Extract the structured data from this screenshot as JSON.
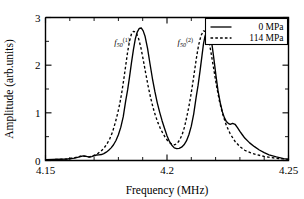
{
  "chart_data": {
    "type": "line",
    "title": "",
    "xlabel": "Frequency (MHz)",
    "ylabel": "Amplitude (arb.units)",
    "xlim": [
      4.15,
      4.25
    ],
    "ylim": [
      0,
      3
    ],
    "xticks": [
      "4.15",
      "4.2",
      "4.25"
    ],
    "xtick_values": [
      4.15,
      4.2,
      4.25
    ],
    "xminor_step": 0.01,
    "yticks": [
      "0",
      "1",
      "2",
      "3"
    ],
    "ytick_values": [
      0,
      1,
      2,
      3
    ],
    "yminor_step": 0.5,
    "grid": false,
    "legend_position": "top-right",
    "annotations": [
      {
        "name": "peak-label-1",
        "base": "f",
        "sub": "50",
        "sup": "(1)",
        "x": 4.1815,
        "y": 2.42
      },
      {
        "name": "peak-label-2",
        "base": "f",
        "sub": "50",
        "sup": "(2)",
        "x": 4.2075,
        "y": 2.42
      }
    ],
    "series": [
      {
        "name": "0 MPa",
        "style": "solid",
        "color": "#000000",
        "x": [
          4.15,
          4.153,
          4.156,
          4.159,
          4.162,
          4.164,
          4.1655,
          4.1668,
          4.168,
          4.169,
          4.17,
          4.171,
          4.172,
          4.173,
          4.174,
          4.175,
          4.176,
          4.177,
          4.178,
          4.179,
          4.18,
          4.181,
          4.182,
          4.183,
          4.1838,
          4.1846,
          4.1854,
          4.1862,
          4.187,
          4.1878,
          4.1886,
          4.1894,
          4.1902,
          4.191,
          4.192,
          4.193,
          4.194,
          4.195,
          4.196,
          4.197,
          4.198,
          4.199,
          4.2,
          4.201,
          4.202,
          4.203,
          4.204,
          4.205,
          4.206,
          4.207,
          4.208,
          4.209,
          4.21,
          4.211,
          4.212,
          4.2128,
          4.2136,
          4.2144,
          4.215,
          4.2156,
          4.2162,
          4.217,
          4.2178,
          4.2186,
          4.2194,
          4.2202,
          4.221,
          4.222,
          4.2228,
          4.2236,
          4.2244,
          4.2252,
          4.226,
          4.227,
          4.228,
          4.229,
          4.23,
          4.231,
          4.232,
          4.234,
          4.236,
          4.238,
          4.24,
          4.242,
          4.245,
          4.248,
          4.25
        ],
        "y": [
          0.02,
          0.022,
          0.026,
          0.032,
          0.05,
          0.075,
          0.095,
          0.085,
          0.07,
          0.08,
          0.1,
          0.115,
          0.118,
          0.125,
          0.145,
          0.175,
          0.215,
          0.265,
          0.33,
          0.42,
          0.54,
          0.7,
          0.92,
          1.25,
          1.48,
          1.76,
          2.06,
          2.33,
          2.56,
          2.7,
          2.77,
          2.78,
          2.72,
          2.6,
          2.35,
          2.03,
          1.72,
          1.45,
          1.21,
          1.01,
          0.83,
          0.67,
          0.52,
          0.4,
          0.32,
          0.265,
          0.25,
          0.255,
          0.28,
          0.33,
          0.41,
          0.54,
          0.72,
          0.98,
          1.33,
          1.58,
          1.88,
          2.2,
          2.44,
          2.6,
          2.69,
          2.7,
          2.62,
          2.4,
          2.09,
          1.76,
          1.46,
          1.19,
          1.02,
          0.9,
          0.82,
          0.78,
          0.76,
          0.78,
          0.76,
          0.69,
          0.61,
          0.54,
          0.47,
          0.37,
          0.29,
          0.22,
          0.165,
          0.12,
          0.075,
          0.04,
          0.025
        ]
      },
      {
        "name": "114 MPa",
        "style": "dashed",
        "color": "#000000",
        "x": [
          4.15,
          4.153,
          4.156,
          4.159,
          4.1615,
          4.1635,
          4.165,
          4.1665,
          4.168,
          4.1692,
          4.1704,
          4.1716,
          4.1728,
          4.174,
          4.1752,
          4.1764,
          4.1776,
          4.1788,
          4.1798,
          4.1806,
          4.1814,
          4.1822,
          4.183,
          4.1838,
          4.1846,
          4.1854,
          4.1862,
          4.1872,
          4.1882,
          4.1892,
          4.1902,
          4.1912,
          4.1922,
          4.1932,
          4.1942,
          4.1952,
          4.1962,
          4.1972,
          4.1982,
          4.1992,
          4.2002,
          4.2012,
          4.2022,
          4.2032,
          4.2042,
          4.2052,
          4.2062,
          4.2072,
          4.2082,
          4.209,
          4.2098,
          4.2106,
          4.2114,
          4.2122,
          4.213,
          4.214,
          4.215,
          4.216,
          4.217,
          4.218,
          4.2192,
          4.2204,
          4.2216,
          4.223,
          4.2244,
          4.226,
          4.228,
          4.23,
          4.232,
          4.2345,
          4.237,
          4.24,
          4.243,
          4.246,
          4.25
        ],
        "y": [
          0.018,
          0.02,
          0.024,
          0.032,
          0.052,
          0.078,
          0.098,
          0.088,
          0.075,
          0.092,
          0.118,
          0.15,
          0.195,
          0.255,
          0.34,
          0.45,
          0.6,
          0.81,
          1.01,
          1.2,
          1.43,
          1.7,
          1.99,
          2.28,
          2.51,
          2.66,
          2.71,
          2.69,
          2.58,
          2.38,
          2.12,
          1.84,
          1.57,
          1.33,
          1.12,
          0.95,
          0.8,
          0.68,
          0.58,
          0.49,
          0.42,
          0.37,
          0.335,
          0.33,
          0.36,
          0.43,
          0.54,
          0.7,
          0.93,
          1.13,
          1.36,
          1.62,
          1.9,
          2.18,
          2.42,
          2.62,
          2.72,
          2.7,
          2.56,
          2.3,
          1.93,
          1.56,
          1.24,
          0.96,
          0.74,
          0.56,
          0.4,
          0.29,
          0.215,
          0.16,
          0.12,
          0.085,
          0.06,
          0.04,
          0.026
        ]
      }
    ]
  },
  "legend": {
    "entries": [
      {
        "label": "0 MPa",
        "style": "solid"
      },
      {
        "label": "114 MPa",
        "style": "dashed"
      }
    ]
  }
}
